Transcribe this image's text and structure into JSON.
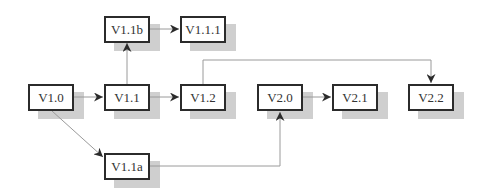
{
  "diagram": {
    "type": "version-tree",
    "nodes": [
      {
        "id": "v1_0",
        "label": "V1.0",
        "x": 28,
        "y": 84
      },
      {
        "id": "v1_1",
        "label": "V1.1",
        "x": 104,
        "y": 84
      },
      {
        "id": "v1_2",
        "label": "V1.2",
        "x": 180,
        "y": 84
      },
      {
        "id": "v1_1b",
        "label": "V1.1b",
        "x": 104,
        "y": 16
      },
      {
        "id": "v1_1_1",
        "label": "V1.1.1",
        "x": 180,
        "y": 16
      },
      {
        "id": "v1_1a",
        "label": "V1.1a",
        "x": 104,
        "y": 153
      },
      {
        "id": "v2_0",
        "label": "V2.0",
        "x": 257,
        "y": 84
      },
      {
        "id": "v2_1",
        "label": "V2.1",
        "x": 332,
        "y": 84
      },
      {
        "id": "v2_2",
        "label": "V2.2",
        "x": 408,
        "y": 84
      }
    ],
    "edges": [
      {
        "from": "V1.0",
        "to": "V1.1"
      },
      {
        "from": "V1.1",
        "to": "V1.2"
      },
      {
        "from": "V1.1",
        "to": "V1.1b"
      },
      {
        "from": "V1.1b",
        "to": "V1.1.1"
      },
      {
        "from": "V1.0",
        "to": "V1.1a"
      },
      {
        "from": "V1.1a",
        "to": "V2.0"
      },
      {
        "from": "V2.0",
        "to": "V2.1"
      },
      {
        "from": "V1.2",
        "to": "V2.2"
      }
    ],
    "colors": {
      "box_border": "#2b2b2b",
      "shadow": "#cfcfcf",
      "line": "#9a9a9a",
      "arrow": "#2b2b2b"
    }
  }
}
